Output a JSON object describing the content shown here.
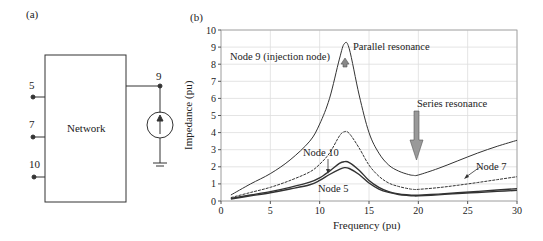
{
  "panel_a": {
    "label": "(a)",
    "network_label": "Network",
    "nodes": [
      {
        "id": "5",
        "label": "5"
      },
      {
        "id": "7",
        "label": "7"
      },
      {
        "id": "10",
        "label": "10"
      },
      {
        "id": "9",
        "label": "9"
      }
    ],
    "source": "current-source",
    "ground": "ground"
  },
  "panel_b": {
    "label": "(b)",
    "annotations": {
      "node9": "Node 9 (injection node)",
      "parallel": "Parallel resonance",
      "series": "Series resonance",
      "node10": "Node 10",
      "node7": "Node 7",
      "node5": "Node 5"
    }
  },
  "chart_data": {
    "type": "line",
    "title": "",
    "xlabel": "Frequency (pu)",
    "ylabel": "Impedance (pu)",
    "xlim": [
      0,
      30
    ],
    "ylim": [
      0,
      10
    ],
    "xticks": [
      0,
      5,
      10,
      15,
      20,
      25,
      30
    ],
    "yticks": [
      0,
      1,
      2,
      3,
      4,
      5,
      6,
      7,
      8,
      9,
      10
    ],
    "grid": true,
    "legend": "none (inline annotations)",
    "x": [
      1,
      3,
      5,
      7,
      9,
      10,
      11,
      12,
      12.5,
      13,
      14,
      15,
      16,
      17,
      18,
      19,
      19.5,
      20,
      22,
      24,
      26,
      28,
      30
    ],
    "series": [
      {
        "name": "Node 9 (injection node)",
        "values": [
          0.35,
          1.0,
          1.6,
          2.4,
          3.5,
          4.5,
          6.0,
          8.3,
          9.2,
          8.9,
          6.2,
          4.0,
          2.8,
          2.1,
          1.75,
          1.55,
          1.5,
          1.52,
          1.9,
          2.35,
          2.8,
          3.2,
          3.55
        ]
      },
      {
        "name": "Node 7",
        "values": [
          0.2,
          0.5,
          0.8,
          1.2,
          1.7,
          2.15,
          2.8,
          3.8,
          4.05,
          3.95,
          3.1,
          2.1,
          1.45,
          1.05,
          0.85,
          0.72,
          0.68,
          0.68,
          0.78,
          0.92,
          1.08,
          1.25,
          1.42
        ]
      },
      {
        "name": "Node 10",
        "values": [
          0.15,
          0.35,
          0.55,
          0.8,
          1.1,
          1.35,
          1.75,
          2.2,
          2.3,
          2.25,
          1.8,
          1.2,
          0.8,
          0.55,
          0.42,
          0.36,
          0.34,
          0.34,
          0.4,
          0.48,
          0.56,
          0.64,
          0.72
        ]
      },
      {
        "name": "Node 5",
        "values": [
          0.12,
          0.3,
          0.48,
          0.7,
          0.95,
          1.2,
          1.55,
          1.85,
          1.95,
          1.9,
          1.55,
          1.05,
          0.7,
          0.5,
          0.38,
          0.32,
          0.3,
          0.3,
          0.36,
          0.44,
          0.5,
          0.56,
          0.62
        ]
      }
    ]
  }
}
